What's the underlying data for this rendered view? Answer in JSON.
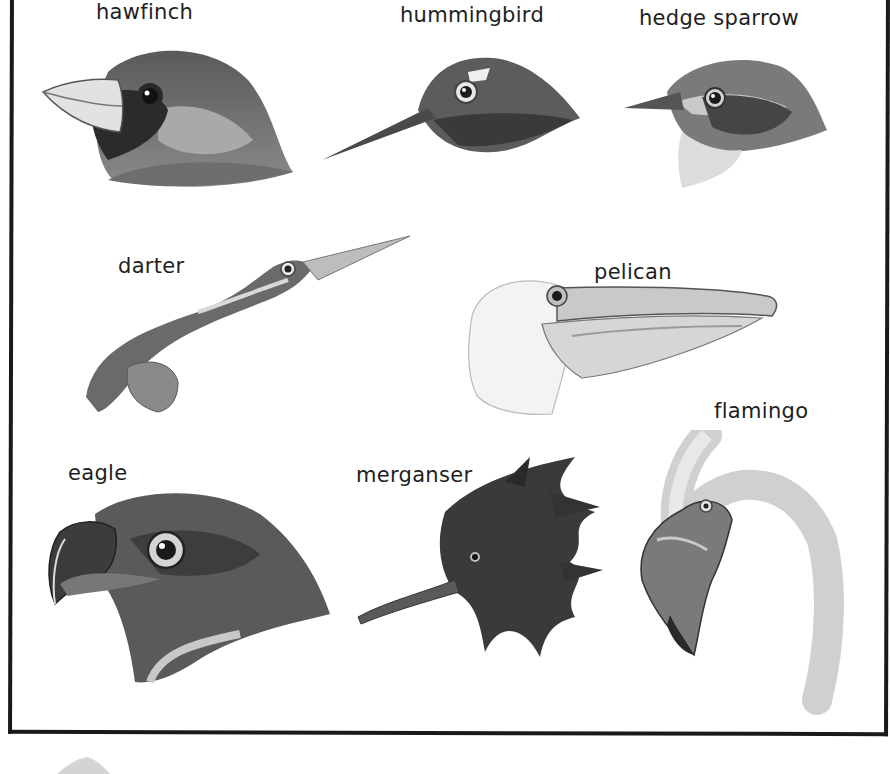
{
  "plate": {
    "type": "bird head illustration plate",
    "border_color": "#1a1a1a",
    "background": "#ffffff",
    "ink_colors": {
      "dark": "#2a2a2a",
      "mid": "#6b6b6b",
      "light": "#b8b8b8",
      "pale": "#e6e6e6"
    }
  },
  "birds": [
    {
      "id": "hawfinch",
      "label": "hawfinch",
      "row": 1,
      "position": "left"
    },
    {
      "id": "hummingbird",
      "label": "hummingbird",
      "row": 1,
      "position": "center"
    },
    {
      "id": "hedge-sparrow",
      "label": "hedge sparrow",
      "row": 1,
      "position": "right"
    },
    {
      "id": "darter",
      "label": "darter",
      "row": 2,
      "position": "left"
    },
    {
      "id": "pelican",
      "label": "pelican",
      "row": 2,
      "position": "right"
    },
    {
      "id": "eagle",
      "label": "eagle",
      "row": 3,
      "position": "left"
    },
    {
      "id": "merganser",
      "label": "merganser",
      "row": 3,
      "position": "center"
    },
    {
      "id": "flamingo",
      "label": "flamingo",
      "row": 3,
      "position": "right"
    }
  ]
}
